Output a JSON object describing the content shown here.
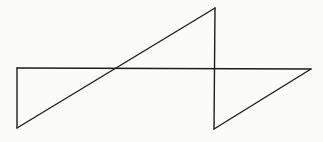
{
  "diagram": {
    "line_color": "#1c1c1c",
    "background_color": "#fbfbfa",
    "vertices": [
      {
        "id": "A",
        "label": ""
      },
      {
        "id": "B",
        "label": ""
      },
      {
        "id": "C",
        "label": ""
      },
      {
        "id": "D",
        "label": ""
      },
      {
        "id": "E",
        "label": ""
      }
    ],
    "edges": [
      {
        "from": "A",
        "to": "B",
        "kind": "vertical"
      },
      {
        "from": "B",
        "to": "C",
        "kind": "diagonal"
      },
      {
        "from": "C",
        "to": "D",
        "kind": "vertical"
      },
      {
        "from": "D",
        "to": "E",
        "kind": "diagonal"
      },
      {
        "from": "E",
        "to": "A",
        "kind": "horizontal"
      }
    ]
  }
}
